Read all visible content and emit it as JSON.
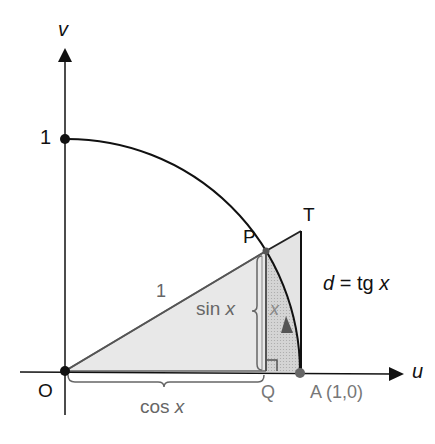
{
  "diagram": {
    "axis_labels": {
      "u": "u",
      "v": "v"
    },
    "points": {
      "origin": "O",
      "one_on_v": "1",
      "P": "P",
      "T": "T",
      "Q": "Q",
      "A": "A (1,0)"
    },
    "labels": {
      "hypotenuse": "1",
      "sin": "sin",
      "cos": "cos",
      "var": "x",
      "arc_x": "x",
      "d_eq_prefix": "d",
      "d_eq_mid": " = tg ",
      "d_eq_var": "x"
    },
    "colors": {
      "axis": "#111111",
      "gray_text": "#666666",
      "light_fill": "#e6e6e6",
      "dark_fill": "#c8c8c8",
      "outline": "#555555"
    }
  }
}
